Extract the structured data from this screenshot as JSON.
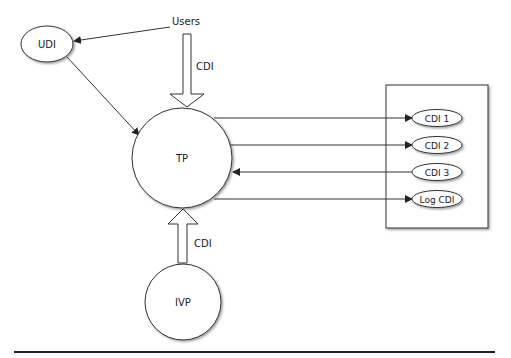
{
  "diagram": {
    "nodes": {
      "users": {
        "label": "Users"
      },
      "udi": {
        "label": "UDI"
      },
      "tp": {
        "label": "TP"
      },
      "ivp": {
        "label": "IVP"
      }
    },
    "arrows": {
      "users_to_tp": {
        "label": "CDI"
      },
      "ivp_to_tp": {
        "label": "CDI"
      }
    },
    "cdi_box": {
      "items": [
        {
          "label": "CDI 1",
          "direction": "tp-to-cdi"
        },
        {
          "label": "CDI 2",
          "direction": "tp-to-cdi"
        },
        {
          "label": "CDI 3",
          "direction": "cdi-to-tp"
        },
        {
          "label": "Log CDI",
          "direction": "tp-to-cdi"
        }
      ]
    },
    "colors": {
      "stroke": "#333333",
      "fill": "#ffffff",
      "shadow": "#9a9a9a"
    }
  }
}
